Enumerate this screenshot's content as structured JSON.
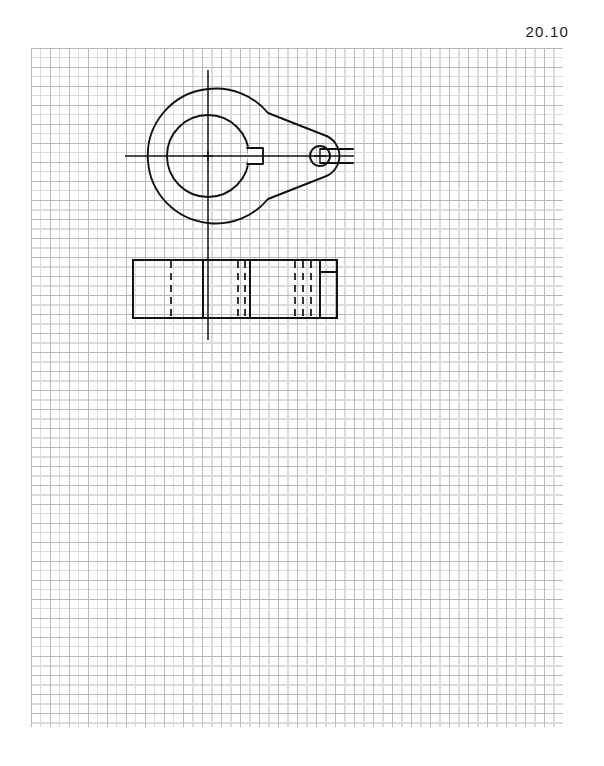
{
  "sheet": {
    "figure_number": "20.10",
    "running_header": "",
    "paper": "graph-paper",
    "width_px": 604,
    "height_px": 766
  },
  "grid": {
    "left": 31,
    "top": 48,
    "width": 532,
    "height": 679,
    "minor_spacing_px": 9.5,
    "major_every_n_cells": 2,
    "minor_color": "#dcdcdc",
    "major_color": "#b9b9b9"
  },
  "drawing": {
    "title": "Cam plate - plan and side elevation",
    "line_color": "#111111",
    "views": [
      {
        "name": "plan-view",
        "type": "outline",
        "description": "Teardrop / pear shaped cam plate",
        "features": [
          "large-circular-boss",
          "tapered-nose",
          "central-bore-with-keyway",
          "small-pin-hole-with-slot",
          "horizontal-centerline",
          "vertical-centerline"
        ],
        "outer_arc": {
          "cx": 208,
          "cy": 156,
          "r": 67
        },
        "nose_arc": {
          "cx": 331,
          "cy": 156,
          "r": 22
        },
        "central_bore": {
          "cx": 208,
          "cy": 156,
          "r": 41
        },
        "keyway": {
          "x": 249,
          "y": 148,
          "width": 14,
          "height": 16
        },
        "pin_hole": {
          "cx": 320,
          "cy": 156,
          "r": 10
        },
        "pin_slot": {
          "x": 320,
          "y": 149,
          "width": 33,
          "height": 14
        }
      },
      {
        "name": "side-elevation",
        "type": "outline",
        "description": "Rectangular side view of the plate thickness",
        "rect": {
          "x": 133,
          "y": 260,
          "width": 204,
          "height": 58
        },
        "hidden_lines_x": [
          171,
          238,
          245,
          295,
          303,
          311
        ],
        "visible_lines_x": [
          203,
          250,
          320
        ],
        "step_detail": {
          "x": 320,
          "y": 272,
          "width": 17,
          "height": 46
        }
      }
    ],
    "centerlines": {
      "horizontal": {
        "x1": 125,
        "y1": 156,
        "x2": 354,
        "y2": 156
      },
      "vertical": {
        "x1": 208,
        "y1": 70,
        "x2": 208,
        "y2": 340
      }
    }
  }
}
